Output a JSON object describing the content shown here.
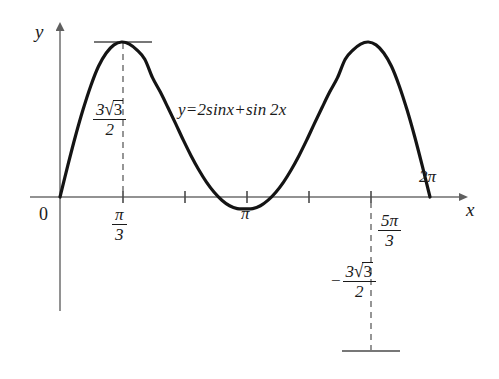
{
  "chart_data": {
    "type": "line",
    "title": "",
    "equation_label": "y=2sin x+sin 2x",
    "function": "y = 2 sin x + sin 2x",
    "xlabel": "x",
    "ylabel": "y",
    "xlim": [
      0,
      6.816
    ],
    "ylim": [
      -3.3,
      3.3
    ],
    "grid": false,
    "legend": "none",
    "x_ticks": [
      {
        "value": 0,
        "label": "0",
        "shown": true
      },
      {
        "value": 1.0472,
        "label": "π/3",
        "numerator": "π",
        "denominator": "3",
        "shown": true
      },
      {
        "value": 2.0944,
        "label": "2π/3",
        "shown": false
      },
      {
        "value": 3.1416,
        "label": "π",
        "shown": true
      },
      {
        "value": 4.1888,
        "label": "4π/3",
        "shown": false
      },
      {
        "value": 5.236,
        "label": "5π/3",
        "numerator": "5π",
        "denominator": "3",
        "shown": true
      },
      {
        "value": 6.2832,
        "label": "2π",
        "shown": true
      }
    ],
    "y_ticks": [],
    "annotations": [
      {
        "name": "maximum",
        "x": 1.0472,
        "y": 2.598,
        "value_text": "3√3/2",
        "numerator_prefix": "3",
        "numerator_radicand": "3",
        "denominator": "2",
        "sign": "",
        "marker": "horizontal-tangent-and-dashed-dropline"
      },
      {
        "name": "minimum",
        "x": 5.236,
        "y": -2.598,
        "value_text": "-3√3/2",
        "numerator_prefix": "3",
        "numerator_radicand": "3",
        "denominator": "2",
        "sign": "−",
        "marker": "horizontal-tangent-and-dashed-dropline"
      },
      {
        "name": "inflection",
        "x": 3.1416,
        "y": 0,
        "value_text": "π",
        "marker": "axis-crossing"
      }
    ],
    "series": [
      {
        "name": "y=2sin x+sin 2x",
        "color": "#141414",
        "width": 3.2,
        "x": [
          0,
          0.1309,
          0.2618,
          0.3927,
          0.5236,
          0.6545,
          0.7854,
          0.9163,
          1.0472,
          1.1781,
          1.309,
          1.4399,
          1.5708,
          1.7017,
          1.8326,
          1.9635,
          2.0944,
          2.2253,
          2.3562,
          2.4871,
          2.618,
          2.7489,
          2.8798,
          3.0107,
          3.1416,
          3.2725,
          3.4034,
          3.5343,
          3.6652,
          3.7961,
          3.927,
          4.0579,
          4.1888,
          4.3197,
          4.4506,
          4.5815,
          4.7124,
          4.8433,
          4.9742,
          5.1051,
          5.236,
          5.3669,
          5.4978,
          5.6287,
          5.7596,
          5.8905,
          6.0214,
          6.1523,
          6.2832
        ],
        "y": [
          0,
          0.5206,
          1.0176,
          1.4694,
          1.866,
          2.1915,
          2.4142,
          2.5503,
          2.5981,
          2.5637,
          2.462,
          2.3097,
          2.0,
          1.7627,
          1.5,
          1.2308,
          0.9526,
          0.6933,
          0.4571,
          0.2495,
          0.0794,
          -0.0532,
          -0.1465,
          -0.1949,
          -0.2,
          -0.1949,
          -0.1465,
          -0.0532,
          0.0794,
          0.2495,
          0.4571,
          0.6933,
          0.9526,
          1.2308,
          1.5,
          1.7627,
          2.0,
          2.3097,
          2.462,
          2.5637,
          2.5981,
          2.5503,
          2.4142,
          2.1915,
          1.866,
          1.4694,
          1.0176,
          0.5206,
          0
        ]
      }
    ],
    "axes_style": {
      "color": "#6e6e6e",
      "arrow_heads": [
        "x-positive",
        "y-positive"
      ],
      "tick_color": "#4a4a4a",
      "dashed_guide_color": "#6a6a6a"
    }
  },
  "labels": {
    "y_axis": "y",
    "x_axis": "x",
    "origin": "0",
    "pi": "π",
    "two_pi": "2π",
    "pi_over_3_num": "π",
    "pi_over_3_den": "3",
    "five_pi_over_3_num": "5π",
    "five_pi_over_3_den": "3",
    "max_value_num_coef": "3",
    "max_value_radicand": "3",
    "max_value_den": "2",
    "min_value_sign": "−",
    "min_value_num_coef": "3",
    "min_value_radicand": "3",
    "min_value_den": "2",
    "radical_sign": "√",
    "equation": "y=2sin",
    "equation_var1": "x",
    "equation_plus": "+sin 2",
    "equation_var2": "x"
  }
}
